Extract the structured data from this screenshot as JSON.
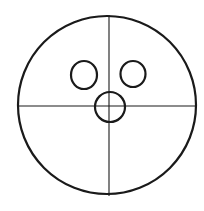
{
  "diagram": {
    "stroke_color": "#1a1a1a",
    "background": "#ffffff",
    "shapes": {
      "outer_circle": {
        "cx": 107,
        "cy": 105,
        "r": 89
      },
      "vertical_line": {
        "x1": 109,
        "y1": 15,
        "x2": 109,
        "y2": 196
      },
      "horizontal_line": {
        "x1": 19,
        "y1": 106,
        "x2": 196,
        "y2": 106
      },
      "left_eye": {
        "cx": 84,
        "cy": 75,
        "rx": 13,
        "ry": 14
      },
      "right_eye": {
        "cx": 133,
        "cy": 74,
        "rx": 12.5,
        "ry": 13
      },
      "center_circle": {
        "cx": 110,
        "cy": 107,
        "r": 15
      }
    }
  }
}
